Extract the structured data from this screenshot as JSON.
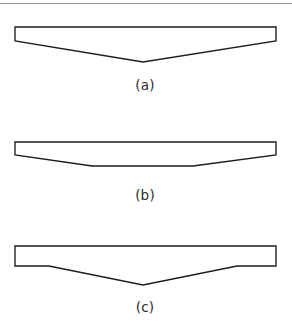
{
  "figure": {
    "background_color": "#ffffff",
    "line_color": "#1c1c1c",
    "fill_color": "#ffffff",
    "label_color": "#2b2b2b",
    "top_rule_color": "#9a9a9a",
    "width": 292,
    "height": 327,
    "top_rule": {
      "name": "top-divider-line",
      "x1": 0,
      "y1": 3.5,
      "x2": 292,
      "y2": 3.5
    },
    "panels": [
      {
        "id": "a",
        "label": "(a)",
        "label_x": 145,
        "label_y": 90,
        "description": "bar with full-width V-shaped bottom notch",
        "points": "15,27 276,27 276,41 143,62 15,41"
      },
      {
        "id": "b",
        "label": "(b)",
        "label_x": 145,
        "label_y": 200,
        "description": "bar with shallow trapezoidal bottom notch, flat base",
        "points": "15,142 276,142 276,155 193,166 92,166 15,155"
      },
      {
        "id": "c",
        "label": "(c)",
        "label_x": 145,
        "label_y": 312,
        "description": "bar with central V-shaped bottom notch and flat end sections",
        "points": "15,246 276,246 276,266 237,266 143,285 49,266 15,266"
      }
    ]
  }
}
